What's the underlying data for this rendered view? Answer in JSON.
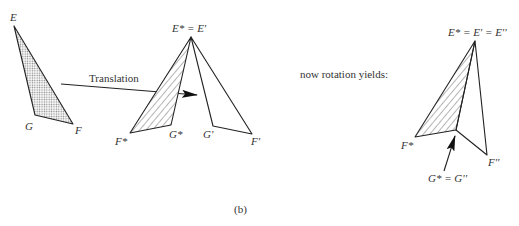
{
  "figure": {
    "caption": "(b)",
    "colors": {
      "stroke": "#222222",
      "text": "#333333",
      "dot_fill": "#9a9a9a",
      "background": "#ffffff"
    }
  },
  "original_triangle": {
    "fill": "dotted",
    "vertices": {
      "E": [
        14,
        26
      ],
      "G": [
        35,
        115
      ],
      "F": [
        73,
        124
      ]
    },
    "labels": {
      "E": "E",
      "G": "G",
      "F": "F"
    }
  },
  "translation": {
    "label": "Translation",
    "arrow_from": [
      61,
      84
    ],
    "arrow_to": [
      197,
      95
    ]
  },
  "middle_triangles": {
    "star": {
      "fill": "hatched",
      "vertices": {
        "E": [
          191,
          37
        ],
        "G": [
          171,
          125
        ],
        "F": [
          130,
          133
        ]
      },
      "labels": {
        "E": "E* = E'",
        "G": "G*",
        "F": "F*"
      }
    },
    "prime": {
      "fill": "none",
      "vertices": {
        "E": [
          191,
          37
        ],
        "G": [
          213,
          126
        ],
        "F": [
          252,
          134
        ]
      },
      "labels": {
        "G": "G'",
        "F": "F'"
      }
    }
  },
  "rotation": {
    "text": "now rotation yields:"
  },
  "right_triangles": {
    "star": {
      "fill": "hatched",
      "vertices": {
        "E": [
          475,
          41
        ],
        "G": [
          456,
          130
        ],
        "F": [
          415,
          137
        ]
      },
      "labels": {
        "E": "E* = E' = E''",
        "F": "F*"
      }
    },
    "double_prime": {
      "fill": "none",
      "vertices": {
        "E": [
          475,
          41
        ],
        "G": [
          456,
          130
        ],
        "F": [
          487,
          155
        ]
      },
      "labels": {
        "F": "F''",
        "G": "G* = G''"
      }
    },
    "pointer_arrow": {
      "from": [
        444,
        171
      ],
      "to": [
        455,
        136
      ]
    }
  }
}
